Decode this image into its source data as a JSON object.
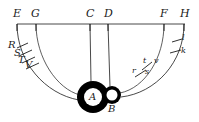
{
  "figure": {
    "background_color": "#ffffff",
    "ink_color": "#1a1a1a"
  },
  "baseline": {
    "label": "horizontal-baseline",
    "y": 24,
    "x_start": 17,
    "x_end": 185
  },
  "top_points": [
    {
      "id": "E",
      "label": "E",
      "x": 17,
      "tick_y_end": 31
    },
    {
      "id": "G",
      "label": "G",
      "x": 36,
      "tick_y_end": 31
    },
    {
      "id": "C",
      "label": "C",
      "x": 90,
      "tick_y_end": 31
    },
    {
      "id": "D",
      "label": "D",
      "x": 108,
      "tick_y_end": 31
    },
    {
      "id": "F",
      "label": "F",
      "x": 164,
      "tick_y_end": 31
    },
    {
      "id": "H",
      "label": "H",
      "x": 184,
      "tick_y_end": 31
    }
  ],
  "circles": [
    {
      "id": "A",
      "label": "A",
      "center_x": 93,
      "center_y": 97,
      "outer_radius": 16,
      "inner_radius": 9,
      "ring_color": "#000000",
      "core_color": "#ffffff",
      "label_color": "#000000"
    },
    {
      "id": "B",
      "label": "B",
      "center_x": 112,
      "center_y": 95,
      "outer_radius": 9,
      "inner_radius": 5.5,
      "ring_color": "#000000",
      "core_color": "#ffffff",
      "label_color": "#1a1a1a"
    }
  ],
  "left_marks": [
    {
      "id": "R",
      "label": "R",
      "x": 10,
      "y": 44
    },
    {
      "id": "S",
      "label": "S",
      "x": 16,
      "y": 52
    },
    {
      "id": "T",
      "label": "T",
      "x": 20,
      "y": 58
    },
    {
      "id": "V",
      "label": "V",
      "x": 27,
      "y": 62
    }
  ],
  "right_marks": [
    {
      "id": "l",
      "label": "l",
      "x": 181,
      "y": 39
    },
    {
      "id": "k",
      "label": "k",
      "x": 180,
      "y": 52
    },
    {
      "id": "t",
      "label": "t",
      "x": 143,
      "y": 62
    },
    {
      "id": "v",
      "label": "v",
      "x": 155,
      "y": 61
    },
    {
      "id": "r",
      "label": "r",
      "x": 133,
      "y": 71
    },
    {
      "id": "s",
      "label": "s",
      "x": 146,
      "y": 72
    }
  ]
}
